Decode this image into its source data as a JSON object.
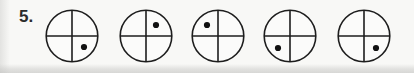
{
  "figure": {
    "item_number": "5.",
    "background_color": "#f7f7f5",
    "ink_color": "#1d1d1d",
    "dot_color": "#111111",
    "circle_count": 5,
    "circle_diameter_px": 54,
    "items": [
      {
        "index": 1,
        "name": "circle-1",
        "left_px": 45,
        "dot_quadrant": "lower-right",
        "dot_cx": 39,
        "dot_cy": 38,
        "dot_r": 3.1
      },
      {
        "index": 2,
        "name": "circle-2",
        "left_px": 119,
        "dot_quadrant": "upper-right",
        "dot_cx": 37,
        "dot_cy": 16,
        "dot_r": 3.1
      },
      {
        "index": 3,
        "name": "circle-3",
        "left_px": 191,
        "dot_quadrant": "upper-left",
        "dot_cx": 16,
        "dot_cy": 16,
        "dot_r": 3.1
      },
      {
        "index": 4,
        "name": "circle-4",
        "left_px": 263,
        "dot_quadrant": "lower-left",
        "dot_cx": 15,
        "dot_cy": 39,
        "dot_r": 3.1
      },
      {
        "index": 5,
        "name": "circle-5",
        "left_px": 337,
        "dot_quadrant": "lower-right",
        "dot_cx": 39,
        "dot_cy": 39,
        "dot_r": 3.1
      }
    ],
    "circle_geometry": {
      "cx": 27,
      "cy": 27,
      "r": 25.8,
      "vertical_line": {
        "x": 27,
        "y1": 1.2,
        "y2": 52.8
      },
      "horizontal_line": {
        "y": 27,
        "x1": 1.2,
        "x2": 52.8
      }
    }
  }
}
